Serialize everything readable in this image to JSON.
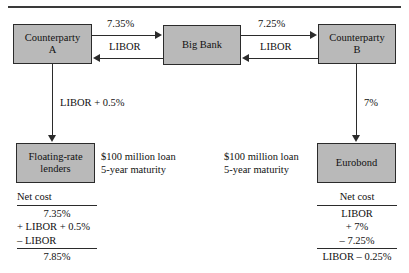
{
  "diagram": {
    "title_rule": "",
    "entities": {
      "counterparty_a_line1": "Counterparty",
      "counterparty_a_line2": "A",
      "big_bank": "Big Bank",
      "counterparty_b_line1": "Counterparty",
      "counterparty_b_line2": "B",
      "floating_rate_line1": "Floating-rate",
      "floating_rate_line2": "lenders",
      "eurobond": "Eurobond"
    },
    "flows": {
      "a_to_bank_fixed": "7.35%",
      "bank_to_a_floating": "LIBOR",
      "bank_to_b_fixed": "7.25%",
      "b_to_bank_floating": "LIBOR",
      "a_to_lenders": "LIBOR + 0.5%",
      "b_to_eurobond": "7%"
    },
    "notes": {
      "left_loan_line1": "$100 million loan",
      "left_loan_line2": "5-year maturity",
      "right_loan_line1": "$100 million loan",
      "right_loan_line2": "5-year maturity"
    },
    "net_cost_left": {
      "title": "Net cost",
      "rows": [
        "7.35%",
        "+ LIBOR + 0.5%",
        "– LIBOR"
      ],
      "total": "7.85%"
    },
    "net_cost_right": {
      "title": "Net cost",
      "rows": [
        "LIBOR",
        "+ 7%",
        "– 7.25%"
      ],
      "total": "LIBOR – 0.25%"
    },
    "colors": {
      "box_fill": "#b9b9b9",
      "line": "#2b2b2b",
      "text": "#111111",
      "background": "#ffffff"
    }
  }
}
